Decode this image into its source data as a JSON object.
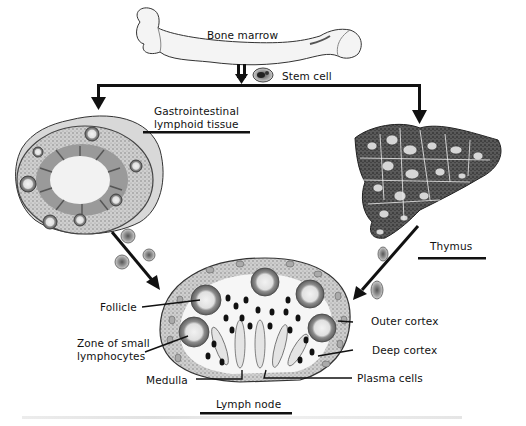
{
  "figure": {
    "labels": {
      "bone_marrow": "Bone marrow",
      "stem_cell": "Stem cell",
      "gi_line1": "Gastrointestinal",
      "gi_line2": "lymphoid tissue",
      "thymus": "Thymus",
      "follicle": "Follicle",
      "zone_line1": "Zone of small",
      "zone_line2": "lymphocytes",
      "medulla": "Medulla",
      "outer_cortex": "Outer cortex",
      "deep_cortex": "Deep cortex",
      "plasma_cells": "Plasma cells",
      "lymph_node": "Lymph node"
    },
    "colors": {
      "ink": "#111111",
      "bone_fill": "#f4f4f4",
      "tissue_mid": "#8a8a8a",
      "tissue_dark": "#2a2a2a",
      "follicle_light": "#e6e6e6"
    }
  }
}
